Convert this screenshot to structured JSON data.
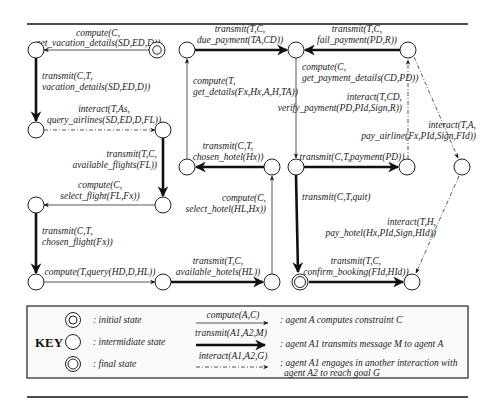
{
  "diagram": {
    "states": [
      {
        "id": "s0",
        "type": "initial",
        "x": 157,
        "y": 50
      },
      {
        "id": "s1",
        "type": "intermediate",
        "x": 36,
        "y": 50
      },
      {
        "id": "s2",
        "type": "intermediate",
        "x": 36,
        "y": 130
      },
      {
        "id": "s3",
        "type": "intermediate",
        "x": 163,
        "y": 130
      },
      {
        "id": "s4",
        "type": "intermediate",
        "x": 163,
        "y": 205
      },
      {
        "id": "s5",
        "type": "intermediate",
        "x": 36,
        "y": 205
      },
      {
        "id": "s6",
        "type": "intermediate",
        "x": 36,
        "y": 282
      },
      {
        "id": "s7",
        "type": "intermediate",
        "x": 163,
        "y": 282
      },
      {
        "id": "s8",
        "type": "intermediate",
        "x": 272,
        "y": 282
      },
      {
        "id": "s9",
        "type": "intermediate",
        "x": 272,
        "y": 167
      },
      {
        "id": "s10",
        "type": "intermediate",
        "x": 187,
        "y": 167
      },
      {
        "id": "s11",
        "type": "intermediate",
        "x": 187,
        "y": 50
      },
      {
        "id": "s12",
        "type": "intermediate",
        "x": 296,
        "y": 50
      },
      {
        "id": "s13",
        "type": "intermediate",
        "x": 408,
        "y": 50
      },
      {
        "id": "s14",
        "type": "intermediate",
        "x": 296,
        "y": 167
      },
      {
        "id": "s15",
        "type": "intermediate",
        "x": 407,
        "y": 167
      },
      {
        "id": "s16",
        "type": "intermediate",
        "x": 462,
        "y": 167
      },
      {
        "id": "s17",
        "type": "final",
        "x": 300,
        "y": 282
      },
      {
        "id": "s18",
        "type": "intermediate",
        "x": 412,
        "y": 282
      }
    ],
    "transitions": [
      {
        "from": "s0",
        "to": "s1",
        "kind": "compute",
        "line1": "compute(C,",
        "line2": "get_vacation_details(SD,ED,D))"
      },
      {
        "from": "s1",
        "to": "s2",
        "kind": "transmit",
        "line1": "transmit(C,T,",
        "line2": "vacation_details(SD,ED,D))"
      },
      {
        "from": "s2",
        "to": "s3",
        "kind": "interact",
        "line1": "interact(T,As,",
        "line2": "query_airlines(SD,ED,D,FL))"
      },
      {
        "from": "s3",
        "to": "s4",
        "kind": "transmit",
        "line1": "transmit(T,C,",
        "line2": "available_flights(FL))"
      },
      {
        "from": "s4",
        "to": "s5",
        "kind": "compute",
        "line1": "compute(C,",
        "line2": "select_flight(FL,Fx))"
      },
      {
        "from": "s5",
        "to": "s6",
        "kind": "transmit",
        "line1": "transmit(C,T,",
        "line2": "chosen_flight(Fx))"
      },
      {
        "from": "s6",
        "to": "s7",
        "kind": "compute",
        "line1": "compute(T,query(HD,D,HL))",
        "line2": ""
      },
      {
        "from": "s7",
        "to": "s8",
        "kind": "transmit",
        "line1": "transmit(T,C,",
        "line2": "available_hotels(HL))"
      },
      {
        "from": "s8",
        "to": "s9",
        "kind": "compute",
        "line1": "compute(C,",
        "line2": "select_hotel(HL,Hx))"
      },
      {
        "from": "s9",
        "to": "s10",
        "kind": "transmit",
        "line1": "transmit(C,T,",
        "line2": "chosen_hotel(Hx))"
      },
      {
        "from": "s10",
        "to": "s11",
        "kind": "compute",
        "line1": "compute(T,",
        "line2": "get_details(Fx,Hx,A,H,TA))"
      },
      {
        "from": "s11",
        "to": "s12",
        "kind": "transmit",
        "line1": "transmit(T,C,",
        "line2": "due_payment(TA,CD))"
      },
      {
        "from": "s13",
        "to": "s12",
        "kind": "transmit",
        "line1": "transmit(T,C,",
        "line2": "fail_payment(PD,R))"
      },
      {
        "from": "s12",
        "to": "s14",
        "kind": "compute",
        "line1": "compute(C,",
        "line2": "get_payment_details(CD,PD))"
      },
      {
        "from": "s15",
        "to": "s13",
        "kind": "interact",
        "line1": "interact(T,CD,",
        "line2": "verify_payment(PD,PId,Sign,R))"
      },
      {
        "from": "s14",
        "to": "s15",
        "kind": "transmit",
        "line1": "transmit(C,T,payment(PD))",
        "line2": ""
      },
      {
        "from": "s13",
        "to": "s16",
        "kind": "interact",
        "line1": "interact(T,A,",
        "line2": "pay_airline(Fx,PId,Sign,FId))"
      },
      {
        "from": "s14",
        "to": "s17",
        "kind": "transmit",
        "line1": "transmit(C,T,quit)",
        "line2": ""
      },
      {
        "from": "s16",
        "to": "s18",
        "kind": "interact",
        "line1": "interact(T,H,",
        "line2": "pay_hotel(Hx,PId,Sign,HId))"
      },
      {
        "from": "s17",
        "to": "s18",
        "kind": "transmit",
        "line1": "transmit(T,C,",
        "line2": "confirm_booking(FId,HId))"
      }
    ]
  },
  "key": {
    "title": "KEY",
    "states": [
      {
        "symbol": "initial",
        "label": ": initial state"
      },
      {
        "symbol": "intermediate",
        "label": ": intermidiate state"
      },
      {
        "symbol": "final",
        "label": ": final state"
      }
    ],
    "arrows": [
      {
        "kind": "compute",
        "arrow_label": "compute(A,C)",
        "desc1": ": agent A computes constraint C",
        "desc2": ""
      },
      {
        "kind": "transmit",
        "arrow_label": "transmit(A1,A2,M)",
        "desc1": ": agent A1 transmits message M to agent A",
        "desc2": ""
      },
      {
        "kind": "interact",
        "arrow_label": "interact(A1,A2,G)",
        "desc1": ": agent A1 engages in another interaction with",
        "desc2": "agent A2 to reach goal G"
      }
    ]
  }
}
